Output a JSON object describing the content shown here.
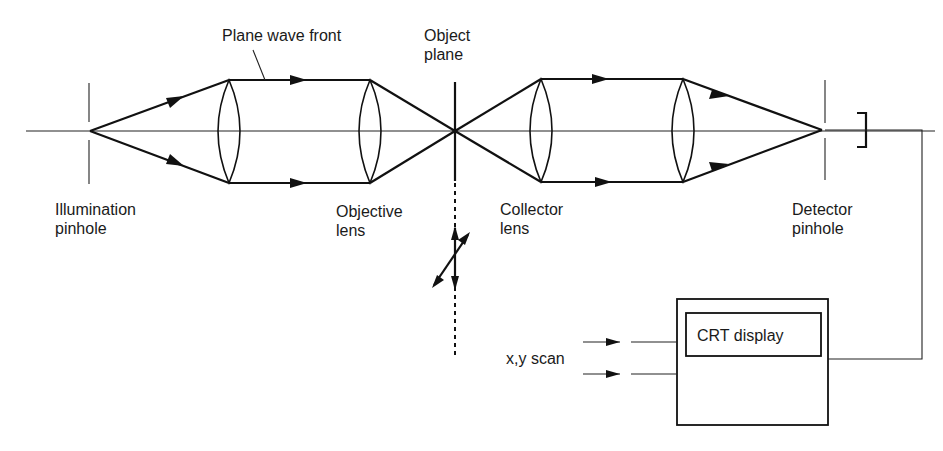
{
  "diagram": {
    "labels": {
      "plane_wave_front": "Plane wave front",
      "object_plane_line1": "Object",
      "object_plane_line2": "plane",
      "illumination_line1": "Illumination",
      "illumination_line2": "pinhole",
      "objective_line1": "Objective",
      "objective_line2": "lens",
      "collector_line1": "Collector",
      "collector_line2": "lens",
      "detector_line1": "Detector",
      "detector_line2": "pinhole",
      "xy_scan": "x,y scan",
      "crt_display": "CRT display"
    },
    "components": [
      {
        "name": "illumination-pinhole",
        "x": 89
      },
      {
        "name": "condenser-lens",
        "x": 229
      },
      {
        "name": "objective-lens",
        "x": 370
      },
      {
        "name": "object-plane",
        "x": 455
      },
      {
        "name": "collector-lens",
        "x": 541
      },
      {
        "name": "projector-lens",
        "x": 683
      },
      {
        "name": "detector-pinhole",
        "x": 822
      },
      {
        "name": "detector",
        "x": 860
      }
    ],
    "colors": {
      "line": "#111111",
      "background": "#ffffff"
    }
  }
}
